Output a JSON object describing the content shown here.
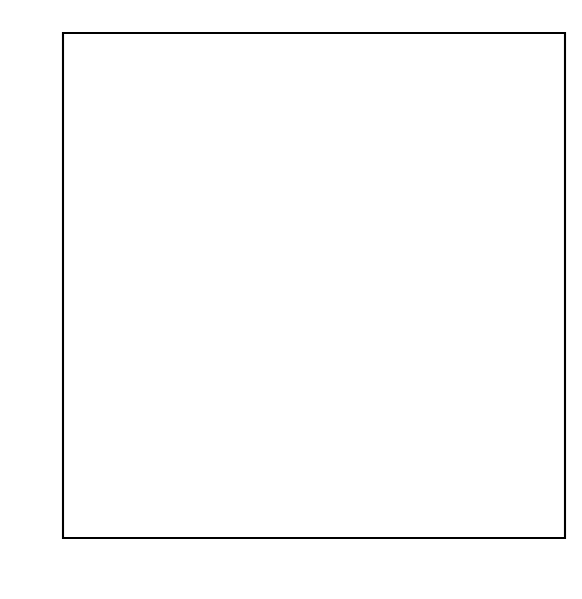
{
  "figure": {
    "background_color": "#ffffff",
    "point_color": "#111111",
    "axis_color": "#000000",
    "text_color": "#1a1a1a"
  },
  "chart_data": {
    "type": "scatter",
    "title": "",
    "xlabel": "Time (min)",
    "ylabel": "Chloride (%)",
    "xlim": [
      2.28,
      8.09
    ],
    "ylim": [
      16.64,
      30.22
    ],
    "xticks": [
      3,
      4,
      5,
      6,
      7,
      8
    ],
    "xtick_labels": [
      "3",
      "4",
      "5",
      "6",
      "7",
      "8"
    ],
    "yticks": [
      18,
      20,
      22,
      24,
      26,
      28,
      30
    ],
    "ytick_labels": [
      "18",
      "20",
      "22",
      "24",
      "26",
      "28",
      "30"
    ],
    "grid": false,
    "legend": null,
    "marker": "filled-circle",
    "marker_size_px": 5.6,
    "n_points": 53,
    "x": [
      2.47,
      2.63,
      2.74,
      2.86,
      2.99,
      3.1,
      3.23,
      3.35,
      3.47,
      3.59,
      3.72,
      3.84,
      3.96,
      4.07,
      4.19,
      4.31,
      4.44,
      4.56,
      4.68,
      4.8,
      4.92,
      5.04,
      5.16,
      5.28,
      5.4,
      5.52,
      5.63,
      5.76,
      5.88,
      6.0,
      6.1,
      6.21,
      6.32,
      6.44,
      6.56,
      6.67,
      6.79,
      6.9,
      7.0,
      7.1,
      7.2,
      7.31,
      7.42,
      7.53,
      7.62,
      7.71,
      7.78
    ],
    "y": [
      17.25,
      17.8,
      18.15,
      18.45,
      18.85,
      19.1,
      19.45,
      19.75,
      20.0,
      20.45,
      21.15,
      21.45,
      21.8,
      22.1,
      22.35,
      22.65,
      22.9,
      23.25,
      23.55,
      23.9,
      24.2,
      24.55,
      25.0,
      25.4,
      25.55,
      25.9,
      26.3,
      26.35,
      26.6,
      26.6,
      27.0,
      27.0,
      27.0,
      27.0,
      27.0,
      27.45,
      28.05,
      28.05,
      28.1,
      28.45,
      28.75,
      29.0,
      29.15,
      29.3,
      29.4,
      29.4,
      29.4
    ]
  }
}
